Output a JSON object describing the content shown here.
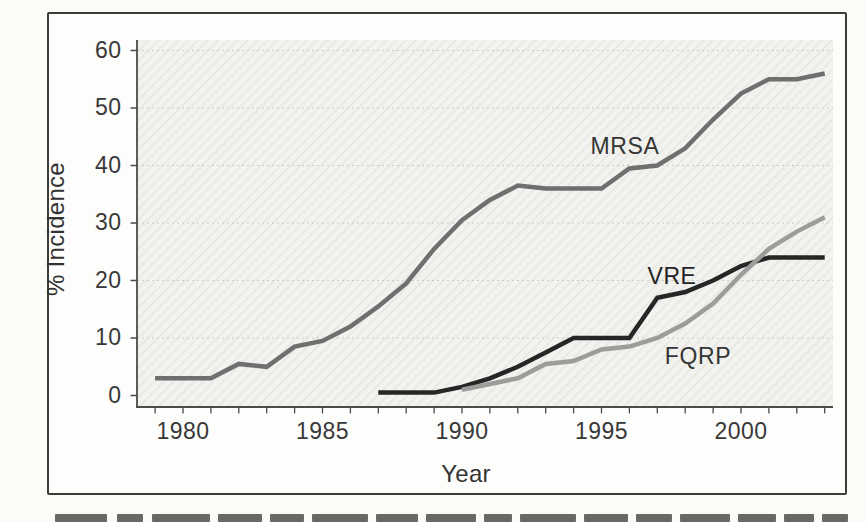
{
  "chart_data": {
    "type": "line",
    "title": "",
    "xlabel": "Year",
    "ylabel": "% Incidence",
    "x_tick_years": [
      1979,
      1980,
      1981,
      1982,
      1983,
      1984,
      1985,
      1986,
      1987,
      1988,
      1989,
      1990,
      1991,
      1992,
      1993,
      1994,
      1995,
      1996,
      1997,
      1998,
      1999,
      2000,
      2001,
      2002,
      2003
    ],
    "x_label_years": [
      1980,
      1985,
      1990,
      1995,
      2000
    ],
    "y_ticks": [
      0,
      10,
      20,
      30,
      40,
      50,
      60
    ],
    "ylim": [
      0,
      60
    ],
    "xlim": [
      1978.3,
      2003.5
    ],
    "grid": "horizontal-dotted",
    "legend": "inline-labels-on-plot",
    "series": [
      {
        "name": "MRSA",
        "color": "#6f6f6f",
        "start_year": 1979,
        "values": [
          3,
          3,
          3,
          5.5,
          5,
          8.5,
          9.5,
          12,
          15.5,
          19.5,
          25.5,
          30.5,
          34,
          36.5,
          36,
          36,
          36,
          39.5,
          40,
          43,
          48,
          52.5,
          55,
          55,
          56
        ]
      },
      {
        "name": "VRE",
        "color": "#262626",
        "start_year": 1987,
        "values": [
          0.5,
          0.5,
          0.5,
          1.5,
          3,
          5,
          7.5,
          10,
          10,
          10,
          17,
          18,
          20,
          22.5,
          24,
          24,
          24
        ]
      },
      {
        "name": "FQRP",
        "color": "#9c9c9a",
        "start_year": 1990,
        "values": [
          1,
          2,
          3,
          5.5,
          6,
          8,
          8.5,
          10,
          12.5,
          16,
          21,
          25.5,
          28.5,
          31
        ]
      }
    ],
    "annotations": [
      {
        "text": "MRSA",
        "px": 625,
        "py": 146
      },
      {
        "text": "VRE",
        "px": 672,
        "py": 276
      },
      {
        "text": "FQRP",
        "px": 698,
        "py": 356
      }
    ]
  },
  "figure": {
    "plot_bg": "#f2f2ef",
    "hatch_color": "#e3e3df",
    "grid_color": "#cdcdc8",
    "axis_color": "#4b4b4b",
    "text_color": "#383838"
  }
}
